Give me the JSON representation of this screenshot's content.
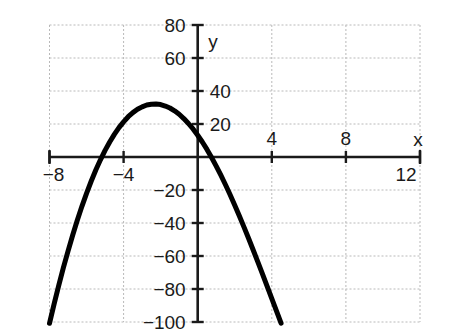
{
  "chart_data": {
    "type": "line",
    "title": "",
    "xlabel": "x",
    "ylabel": "y",
    "xlim": [
      -8,
      12
    ],
    "ylim": [
      -100,
      80
    ],
    "grid": true,
    "legend": null,
    "x_ticks": [
      -8,
      -4,
      4,
      8,
      12
    ],
    "x_tick_labels": [
      "−8",
      "−4",
      "4",
      "8",
      "12"
    ],
    "y_ticks": [
      80,
      60,
      40,
      20,
      -20,
      -40,
      -60,
      -80,
      -100
    ],
    "y_tick_labels": [
      "80",
      "60",
      "40",
      "20",
      "−20",
      "−40",
      "−60",
      "−80",
      "−100"
    ],
    "x_gridlines": [
      -8,
      -4,
      0,
      4,
      8,
      12
    ],
    "y_gridlines": [
      80,
      60,
      40,
      20,
      0,
      -20,
      -40,
      -60,
      -80,
      -100
    ],
    "series": [
      {
        "name": "cubic",
        "color": "#000000",
        "roots": [
          -6,
          0,
          8.4
        ],
        "local_maximum": {
          "x": -3.3,
          "y": 33
        },
        "local_minimum": {
          "x": 5.1,
          "y": -52
        },
        "x": [
          -8.0,
          -7.75,
          -7.5,
          -7.25,
          -7.0,
          -6.75,
          -6.5,
          -6.25,
          -6.0,
          -5.75,
          -5.5,
          -5.25,
          -5.0,
          -4.75,
          -4.5,
          -4.25,
          -4.0,
          -3.75,
          -3.5,
          -3.25,
          -3.0,
          -2.75,
          -2.5,
          -2.25,
          -2.0,
          -1.75,
          -1.5,
          -1.25,
          -1.0,
          -0.75,
          -0.5,
          -0.25,
          0.0,
          0.25,
          0.5,
          0.75,
          1.0,
          1.25,
          1.5,
          1.75,
          2.0,
          2.25,
          2.5,
          2.75,
          3.0,
          3.25,
          3.5,
          3.75,
          4.0,
          4.25,
          4.5,
          4.75,
          5.0,
          5.25,
          5.5,
          5.75,
          6.0,
          6.25,
          6.5,
          6.75,
          7.0,
          7.25,
          7.5,
          7.75,
          8.0,
          8.25,
          8.5,
          8.75,
          9.0,
          9.25,
          9.5,
          9.75,
          10.0,
          10.25,
          10.45
        ],
        "y": [
          -100.8,
          -89.0,
          -77.8,
          -67.1,
          -57.0,
          -47.4,
          -38.4,
          -29.9,
          -22.0,
          -14.7,
          -7.9,
          -1.7,
          4.0,
          9.1,
          13.7,
          17.8,
          21.3,
          24.4,
          26.9,
          28.9,
          30.4,
          31.5,
          32.0,
          32.1,
          31.8,
          30.9,
          29.7,
          28.0,
          25.9,
          23.3,
          20.3,
          17.0,
          13.2,
          9.1,
          4.6,
          -0.3,
          -5.5,
          -11.0,
          -16.8,
          -22.9,
          -29.2,
          -35.7,
          -42.5,
          -49.4,
          -56.5,
          -63.7,
          -71.0,
          -78.4,
          -85.8,
          -93.3,
          -100.7,
          -108.1,
          -115.5,
          -122.7,
          -129.8,
          -136.7,
          -143.4,
          -149.8,
          -155.9,
          -161.6,
          -167.0,
          -171.9,
          -176.3,
          -180.2,
          -183.6,
          -186.3,
          -188.3,
          -189.6,
          -190.1,
          -189.8,
          -188.6,
          -186.4,
          -183.3,
          -179.1,
          -175.0
        ]
      }
    ],
    "equation_note": ""
  },
  "axis": {
    "x_axis_label": "x",
    "y_axis_label": "y"
  },
  "colors": {
    "curve": "#000000",
    "axis": "#1a1a1a",
    "grid": "#b9b9b9",
    "background": "#ffffff",
    "text": "#1a1a1a"
  }
}
